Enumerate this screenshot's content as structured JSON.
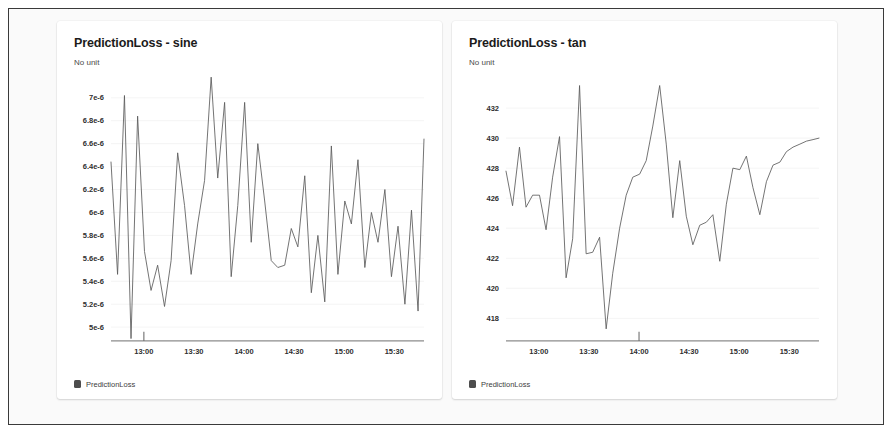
{
  "panels": [
    {
      "title": "PredictionLoss - sine",
      "subtitle": "No unit",
      "legend_label": "PredictionLoss",
      "legend_color": "#4d4d4d"
    },
    {
      "title": "PredictionLoss - tan",
      "subtitle": "No unit",
      "legend_label": "PredictionLoss",
      "legend_color": "#4d4d4d"
    }
  ],
  "chart_data": [
    {
      "type": "line",
      "title": "PredictionLoss - sine",
      "subtitle": "No unit",
      "xlabel": "",
      "ylabel": "No unit",
      "grid": true,
      "legend": [
        "PredictionLoss"
      ],
      "legend_position": "bottom-left",
      "yticks": [
        "7e-6",
        "6.8e-6",
        "6.6e-6",
        "6.4e-6",
        "6.2e-6",
        "6e-6",
        "5.8e-6",
        "5.6e-6",
        "5.4e-6",
        "5.2e-6",
        "5e-6"
      ],
      "ytick_values": [
        7e-06,
        6.8e-06,
        6.6e-06,
        6.4e-06,
        6.2e-06,
        6e-06,
        5.8e-06,
        5.6e-06,
        5.4e-06,
        5.2e-06,
        5e-06
      ],
      "ylim": [
        4.88e-06,
        7.12e-06
      ],
      "xticks": [
        "13:00",
        "13:30",
        "14:00",
        "14:30",
        "15:00",
        "15:30"
      ],
      "xtick_positions": [
        0.105,
        0.265,
        0.425,
        0.585,
        0.745,
        0.905
      ],
      "xlim": [
        0,
        1
      ],
      "series": [
        {
          "name": "PredictionLoss",
          "color": "#5b5b5b",
          "x": [
            0.0,
            0.021,
            0.043,
            0.064,
            0.085,
            0.107,
            0.128,
            0.149,
            0.171,
            0.192,
            0.213,
            0.235,
            0.256,
            0.277,
            0.299,
            0.32,
            0.341,
            0.363,
            0.384,
            0.405,
            0.427,
            0.448,
            0.469,
            0.491,
            0.512,
            0.533,
            0.555,
            0.576,
            0.597,
            0.619,
            0.64,
            0.661,
            0.683,
            0.704,
            0.725,
            0.747,
            0.768,
            0.789,
            0.811,
            0.832,
            0.853,
            0.875,
            0.896,
            0.917,
            0.939,
            0.96,
            0.981,
            1.0
          ],
          "values": [
            6.44e-06,
            5.46e-06,
            7.02e-06,
            4.9e-06,
            6.84e-06,
            5.66e-06,
            5.32e-06,
            5.54e-06,
            5.18e-06,
            5.58e-06,
            6.52e-06,
            6.06e-06,
            5.46e-06,
            5.9e-06,
            6.28e-06,
            7.18e-06,
            6.3e-06,
            6.96e-06,
            5.44e-06,
            6.06e-06,
            6.96e-06,
            5.74e-06,
            6.6e-06,
            6.1e-06,
            5.58e-06,
            5.52e-06,
            5.54e-06,
            5.86e-06,
            5.7e-06,
            6.32e-06,
            5.3e-06,
            5.8e-06,
            5.22e-06,
            6.58e-06,
            5.46e-06,
            6.1e-06,
            5.9e-06,
            6.46e-06,
            5.52e-06,
            6e-06,
            5.74e-06,
            6.2e-06,
            5.44e-06,
            5.88e-06,
            5.2e-06,
            6.02e-06,
            5.14e-06,
            6.64e-06
          ]
        }
      ]
    },
    {
      "type": "line",
      "title": "PredictionLoss - tan",
      "subtitle": "No unit",
      "xlabel": "",
      "ylabel": "No unit",
      "grid": true,
      "legend": [
        "PredictionLoss"
      ],
      "legend_position": "bottom-left",
      "yticks": [
        "432",
        "430",
        "428",
        "426",
        "424",
        "422",
        "420",
        "418"
      ],
      "ytick_values": [
        432,
        430,
        428,
        426,
        424,
        422,
        420,
        418
      ],
      "ylim": [
        416.5,
        433.6
      ],
      "xticks": [
        "13:00",
        "13:30",
        "14:00",
        "14:30",
        "15:00",
        "15:30"
      ],
      "xtick_positions": [
        0.105,
        0.265,
        0.425,
        0.585,
        0.745,
        0.905
      ],
      "xlim": [
        0,
        1
      ],
      "series": [
        {
          "name": "PredictionLoss",
          "color": "#5b5b5b",
          "x": [
            0.0,
            0.021,
            0.043,
            0.064,
            0.085,
            0.107,
            0.128,
            0.149,
            0.171,
            0.192,
            0.213,
            0.235,
            0.256,
            0.277,
            0.299,
            0.32,
            0.341,
            0.363,
            0.384,
            0.405,
            0.427,
            0.448,
            0.469,
            0.491,
            0.512,
            0.533,
            0.555,
            0.576,
            0.597,
            0.619,
            0.64,
            0.661,
            0.683,
            0.704,
            0.725,
            0.747,
            0.768,
            0.789,
            0.811,
            0.832,
            0.853,
            0.875,
            0.896,
            0.917,
            0.939,
            0.96,
            0.981,
            1.0
          ],
          "values": [
            427.8,
            425.5,
            429.4,
            425.4,
            426.2,
            426.2,
            423.9,
            427.4,
            430.1,
            420.7,
            423.3,
            433.5,
            422.3,
            422.4,
            423.4,
            417.3,
            421.0,
            424.0,
            426.2,
            427.4,
            427.6,
            428.5,
            430.8,
            433.5,
            429.6,
            424.7,
            428.5,
            424.8,
            422.9,
            424.2,
            424.4,
            424.9,
            421.8,
            425.6,
            428.0,
            427.9,
            428.8,
            426.7,
            424.9,
            427.1,
            428.2,
            428.4,
            429.1,
            429.4,
            429.6,
            429.8,
            429.9,
            430.0
          ]
        }
      ]
    }
  ]
}
